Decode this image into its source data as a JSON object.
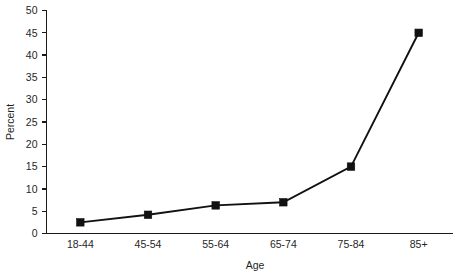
{
  "chart_data": {
    "type": "line",
    "title": "",
    "xlabel": "Age",
    "ylabel": "Percent",
    "categories": [
      "18-44",
      "45-54",
      "55-64",
      "65-74",
      "75-84",
      "85+"
    ],
    "values": [
      2.5,
      4.2,
      6.3,
      7.0,
      15.0,
      45.0
    ],
    "series": [
      {
        "name": "Percent",
        "values": [
          2.5,
          4.2,
          6.3,
          7.0,
          15.0,
          45.0
        ]
      }
    ],
    "ylim": [
      0,
      50
    ],
    "ytick_values": [
      0,
      5,
      10,
      15,
      20,
      25,
      30,
      35,
      40,
      45,
      50
    ],
    "ytick_labels": [
      "0",
      "5",
      "10",
      "15",
      "20",
      "25",
      "30",
      "35",
      "40",
      "45",
      "50"
    ],
    "grid": false,
    "legend": "none",
    "marker": "filled-square",
    "line_color": "#111111",
    "marker_color": "#111111",
    "background_color": "#ffffff",
    "axis_color": "#1a1a1a"
  }
}
